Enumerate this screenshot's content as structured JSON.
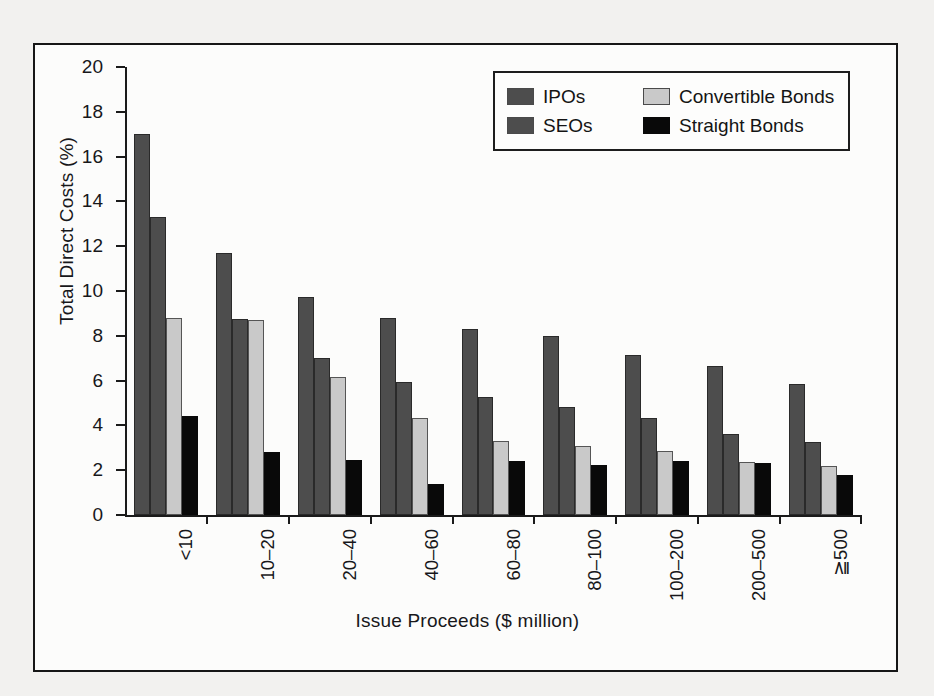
{
  "figure": {
    "frame_color": "#161616",
    "background_color": "#f2f1ef",
    "plot_background": "#fcfcfb"
  },
  "chart_data": {
    "type": "bar",
    "title": "",
    "xlabel": "Issue Proceeds ($ million)",
    "ylabel": "Total Direct Costs (%)",
    "ylim": [
      0,
      20
    ],
    "yticks": [
      0,
      2,
      4,
      6,
      8,
      10,
      12,
      14,
      16,
      18,
      20
    ],
    "ytick_labels": [
      "0",
      "2",
      "4",
      "6",
      "8",
      "10",
      "12",
      "14",
      "16",
      "18",
      "20"
    ],
    "grid": false,
    "legend_position": "top-right",
    "categories": [
      "<10",
      "10–20",
      "20–40",
      "40–60",
      "60–80",
      "80–100",
      "100–200",
      "200–500",
      "≧500"
    ],
    "series": [
      {
        "name": "IPOs",
        "color": "#4d4d4d",
        "values": [
          17.0,
          11.7,
          9.75,
          8.8,
          8.3,
          8.0,
          7.15,
          6.65,
          5.85
        ]
      },
      {
        "name": "SEOs",
        "color": "#4d4d4d",
        "values": [
          13.3,
          8.75,
          7.0,
          5.95,
          5.25,
          4.8,
          4.35,
          3.6,
          3.25
        ]
      },
      {
        "name": "Convertible Bonds",
        "color": "#c9c9c9",
        "values": [
          8.8,
          8.7,
          6.15,
          4.35,
          3.3,
          3.1,
          2.85,
          2.35,
          2.2
        ]
      },
      {
        "name": "Straight Bonds",
        "color": "#090909",
        "values": [
          4.4,
          2.8,
          2.45,
          1.4,
          2.4,
          2.25,
          2.4,
          2.3,
          1.8
        ]
      }
    ]
  }
}
